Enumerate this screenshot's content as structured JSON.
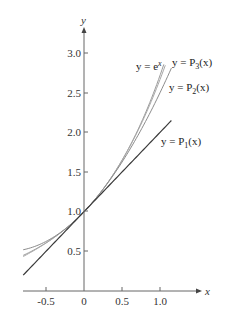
{
  "chart_data": {
    "type": "line",
    "title": "",
    "xlabel": "x",
    "ylabel": "y",
    "xlim": [
      -0.8,
      1.35
    ],
    "ylim": [
      0,
      3.4
    ],
    "grid": false,
    "legend_position": "inline labels at curve ends",
    "x_ticks": [
      "-0.5",
      "0",
      "0.5",
      "1.0"
    ],
    "y_ticks": [
      "0.5",
      "1.0",
      "1.5",
      "2.0",
      "2.5",
      "3.0"
    ],
    "series": [
      {
        "name": "y = e^x",
        "label": "y = e",
        "label_sup": "x",
        "function": "exp(x)",
        "x_range": [
          -0.8,
          1.05
        ],
        "color": "#9a9a9a"
      },
      {
        "name": "y = P3(x)",
        "label": "y = P",
        "label_sub": "3",
        "label_tail": "(x)",
        "function": "1 + x + x^2/2 + x^3/6",
        "x_range": [
          -0.8,
          1.07
        ],
        "color": "#a8a8a8"
      },
      {
        "name": "y = P2(x)",
        "label": "y = P",
        "label_sub": "2",
        "label_tail": "(x)",
        "function": "1 + x + x^2/2",
        "x_range": [
          -0.8,
          1.15
        ],
        "color": "#8c8c8c"
      },
      {
        "name": "y = P1(x)",
        "label": "y = P",
        "label_sub": "1",
        "label_tail": "(x)",
        "function": "1 + x",
        "x_range": [
          -0.8,
          1.15
        ],
        "color": "#3a3a3a"
      }
    ]
  }
}
